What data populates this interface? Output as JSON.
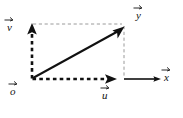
{
  "figure": {
    "kind": "vector-addition-parallelogram-diagram",
    "background_color": "#ffffff",
    "stroke_color": "#111111",
    "dashed_guide_color": "#9a9a9a",
    "width": 183,
    "height": 118
  },
  "labels": {
    "origin": {
      "text": "o",
      "has_vector_arrow": true,
      "meaning": "origin point"
    },
    "basis_vertical": {
      "text": "v",
      "has_vector_arrow": true,
      "meaning": "vertical basis vector"
    },
    "basis_horizontal": {
      "text": "u",
      "has_vector_arrow": true,
      "meaning": "horizontal basis vector"
    },
    "axis_horizontal": {
      "text": "x",
      "has_vector_arrow": true,
      "meaning": "x axis direction"
    },
    "axis_diagonal": {
      "text": "y",
      "has_vector_arrow": true,
      "meaning": "resultant vector endpoint"
    }
  },
  "geometry": {
    "origin_point": [
      32,
      79
    ],
    "vertical_arrow_tip": [
      32,
      24
    ],
    "horizontal_arrow_tip": [
      116,
      79
    ],
    "x_axis_arrow_tip": [
      160,
      79
    ],
    "diagonal_arrow_tip": [
      124,
      26
    ],
    "corner_point": [
      124,
      79
    ],
    "top_guide_y": 24,
    "right_guide_x": 124
  },
  "strokes": {
    "bold_dashed_vertical": "thick black dashed segment from origin upward",
    "bold_dashed_horizontal": "thick black dashed segment from origin rightward",
    "solid_diagonal": "solid black arrow from origin to upper-right point",
    "solid_x_axis": "solid black arrow continuing right along baseline",
    "thin_dashed_top": "light gray dashed horizontal guide",
    "thin_dashed_right": "light gray dashed vertical guide"
  }
}
